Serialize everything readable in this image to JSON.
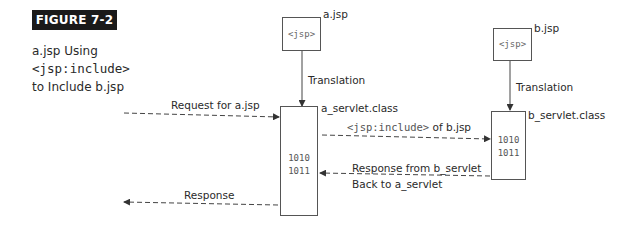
{
  "figure": {
    "label": "FIGURE 7-2",
    "caption_line1": "a.jsp Using",
    "caption_line2": "<jsp:include>",
    "caption_line3": "to Include b.jsp"
  },
  "nodes": {
    "a_jsp": {
      "name": "a.jsp",
      "content": "<jsp>"
    },
    "b_jsp": {
      "name": "b.jsp",
      "content": "<jsp>"
    },
    "a_servlet": {
      "name": "a_servlet.class",
      "bits_line1": "1010",
      "bits_line2": "1011"
    },
    "b_servlet": {
      "name": "b_servlet.class",
      "bits_line1": "1010",
      "bits_line2": "1011"
    }
  },
  "edges": {
    "a_translation": "Translation",
    "b_translation": "Translation",
    "request": "Request for a.jsp",
    "include_mono": "<jsp:include>",
    "include_suffix": " of b.jsp",
    "response_from_b_line1": "Response from b_servlet",
    "response_from_b_line2": "Back to a_servlet",
    "response": "Response"
  }
}
